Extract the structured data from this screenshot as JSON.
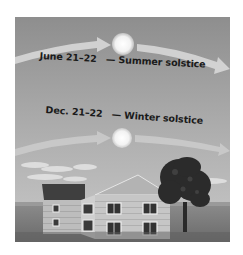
{
  "diagram": {
    "colors": {
      "sky_top": "#8d8d8d",
      "sky_bottom": "#c4c4c4",
      "ground": "#7a7a7a",
      "sun": "#f4f4f4",
      "arrow": "#d6d6d6",
      "text": "#1a1a1a"
    },
    "summer": {
      "date": "June 21–22",
      "label": "— Summer solstice",
      "sun_position": {
        "x": 123,
        "y": 44,
        "r": 11
      }
    },
    "winter": {
      "date": "Dec. 21–22",
      "label": "— Winter solstice",
      "sun_position": {
        "x": 122,
        "y": 138,
        "r": 10
      }
    },
    "scene_elements": [
      "house",
      "tree",
      "clouds",
      "ground",
      "sun-path-arrows"
    ]
  }
}
